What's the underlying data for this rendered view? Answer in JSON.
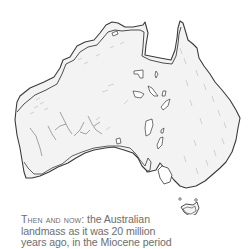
{
  "figure": {
    "type": "map-illustration",
    "caption": {
      "lead": "Then and now:",
      "line1_rest": " the Australian",
      "line2": "landmass as it was 20 million",
      "line3": "years ago, in the Miocene period"
    },
    "colors": {
      "background": "#ffffff",
      "outline": "#3a3a3a",
      "land_fill": "#f3f3f3",
      "hatching": "#b8b8b8",
      "caption_text": "#6e6e6e"
    }
  }
}
